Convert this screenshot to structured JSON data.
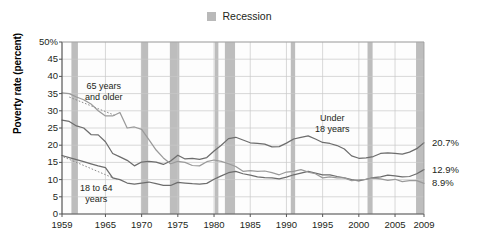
{
  "legend": {
    "swatch_name": "recession-swatch",
    "label": "Recession",
    "color": "#b9b9b9"
  },
  "axis": {
    "ylabel": "Poverty rate (percent)",
    "yticks": [
      "50%",
      "45",
      "40",
      "35",
      "30",
      "25",
      "20",
      "15",
      "10",
      "5",
      "0"
    ],
    "ytick_values": [
      50,
      45,
      40,
      35,
      30,
      25,
      20,
      15,
      10,
      5,
      0
    ],
    "xticks": [
      "1959",
      "1965",
      "1970",
      "1975",
      "1980",
      "1985",
      "1990",
      "1995",
      "2000",
      "2005",
      "2009"
    ],
    "xtick_values": [
      1959,
      1965,
      1970,
      1975,
      1980,
      1985,
      1990,
      1995,
      2000,
      2005,
      2009
    ]
  },
  "annotations": [
    {
      "name": "annot-65-and-older",
      "line1": "65 years",
      "line2": "and older"
    },
    {
      "name": "annot-18-to-64",
      "line1": "18 to 64",
      "line2": "years"
    },
    {
      "name": "annot-under-18",
      "line1": "Under",
      "line2": "18 years"
    }
  ],
  "end_labels": [
    {
      "name": "end-label-under-18",
      "text": "20.7%"
    },
    {
      "name": "end-label-18-to-64",
      "text": "12.9%"
    },
    {
      "name": "end-label-65-plus",
      "text": "8.9%"
    }
  ],
  "chart_data": {
    "type": "line",
    "title": "",
    "xlabel": "",
    "ylabel": "Poverty rate (percent)",
    "xlim": [
      1959,
      2009
    ],
    "ylim": [
      0,
      50
    ],
    "grid": true,
    "legend_position": "top-center",
    "legend_entries": [
      "Recession"
    ],
    "series": [
      {
        "name": "Under 18 years",
        "color": "#6d6d6d",
        "end_value": 20.7,
        "x": [
          1959,
          1960,
          1961,
          1962,
          1963,
          1964,
          1965,
          1966,
          1967,
          1968,
          1969,
          1970,
          1971,
          1972,
          1973,
          1974,
          1975,
          1976,
          1977,
          1978,
          1979,
          1980,
          1981,
          1982,
          1983,
          1984,
          1985,
          1986,
          1987,
          1988,
          1989,
          1990,
          1991,
          1992,
          1993,
          1994,
          1995,
          1996,
          1997,
          1998,
          1999,
          2000,
          2001,
          2002,
          2003,
          2004,
          2005,
          2006,
          2007,
          2008,
          2009
        ],
        "values": [
          27.3,
          26.9,
          25.6,
          25.0,
          23.1,
          23.0,
          21.0,
          17.6,
          16.6,
          15.6,
          14.0,
          15.1,
          15.3,
          15.1,
          14.4,
          15.4,
          17.1,
          16.0,
          16.2,
          15.9,
          16.4,
          18.3,
          20.0,
          21.9,
          22.3,
          21.5,
          20.7,
          20.5,
          20.3,
          19.5,
          19.6,
          20.6,
          21.8,
          22.3,
          22.7,
          21.8,
          20.8,
          20.5,
          19.9,
          18.9,
          16.9,
          16.2,
          16.3,
          16.7,
          17.6,
          17.8,
          17.6,
          17.4,
          18.0,
          19.0,
          20.7
        ]
      },
      {
        "name": "18 to 64 years",
        "color": "#6d6d6d",
        "end_value": 12.9,
        "x": [
          1959,
          1960,
          1961,
          1962,
          1963,
          1964,
          1965,
          1966,
          1967,
          1968,
          1969,
          1970,
          1971,
          1972,
          1973,
          1974,
          1975,
          1976,
          1977,
          1978,
          1979,
          1980,
          1981,
          1982,
          1983,
          1984,
          1985,
          1986,
          1987,
          1988,
          1989,
          1990,
          1991,
          1992,
          1993,
          1994,
          1995,
          1996,
          1997,
          1998,
          1999,
          2000,
          2001,
          2002,
          2003,
          2004,
          2005,
          2006,
          2007,
          2008,
          2009
        ],
        "values": [
          17.0,
          16.4,
          15.8,
          15.2,
          14.6,
          14.0,
          13.5,
          10.5,
          10.0,
          9.0,
          8.7,
          9.0,
          9.3,
          8.8,
          8.3,
          8.3,
          9.2,
          9.0,
          8.8,
          8.7,
          8.9,
          10.1,
          11.1,
          12.0,
          12.4,
          11.7,
          11.3,
          10.8,
          10.6,
          10.5,
          10.2,
          10.7,
          11.4,
          11.9,
          12.4,
          11.9,
          11.4,
          11.4,
          10.9,
          10.5,
          10.0,
          9.6,
          10.1,
          10.6,
          10.8,
          11.3,
          11.1,
          10.8,
          10.9,
          11.7,
          12.9
        ]
      },
      {
        "name": "65 years and older",
        "color": "#9a9a9a",
        "end_value": 8.9,
        "x": [
          1959,
          1960,
          1961,
          1962,
          1963,
          1964,
          1965,
          1966,
          1967,
          1968,
          1969,
          1970,
          1971,
          1972,
          1973,
          1974,
          1975,
          1976,
          1977,
          1978,
          1979,
          1980,
          1981,
          1982,
          1983,
          1984,
          1985,
          1986,
          1987,
          1988,
          1989,
          1990,
          1991,
          1992,
          1993,
          1994,
          1995,
          1996,
          1997,
          1998,
          1999,
          2000,
          2001,
          2002,
          2003,
          2004,
          2005,
          2006,
          2007,
          2008,
          2009
        ],
        "values": [
          35.2,
          35.0,
          34.0,
          33.2,
          32.0,
          30.0,
          28.5,
          28.5,
          29.5,
          25.0,
          25.3,
          24.6,
          21.6,
          18.6,
          16.3,
          14.6,
          15.3,
          15.0,
          14.1,
          14.0,
          15.2,
          15.7,
          15.3,
          14.6,
          13.8,
          12.4,
          12.6,
          12.4,
          12.5,
          12.0,
          11.4,
          12.2,
          12.4,
          12.9,
          12.2,
          11.7,
          10.5,
          10.8,
          10.5,
          10.5,
          9.7,
          9.9,
          10.1,
          10.4,
          10.2,
          9.8,
          10.1,
          9.4,
          9.7,
          9.7,
          8.9
        ]
      }
    ],
    "recession_bands": [
      {
        "start": 1960.3,
        "end": 1961.2
      },
      {
        "start": 1969.9,
        "end": 1970.9
      },
      {
        "start": 1973.9,
        "end": 1975.2
      },
      {
        "start": 1980.1,
        "end": 1980.6
      },
      {
        "start": 1981.5,
        "end": 1982.9
      },
      {
        "start": 1990.6,
        "end": 1991.2
      },
      {
        "start": 2001.2,
        "end": 2001.9
      },
      {
        "start": 2007.9,
        "end": 2009.4
      }
    ],
    "dotted_leaders": [
      {
        "name": "leader-65-plus",
        "x1": 1960.0,
        "y1": 34.0,
        "x2": 1966.5,
        "y2": 28.5
      },
      {
        "name": "leader-18-64",
        "x1": 1959.2,
        "y1": 16.6,
        "x2": 1966.6,
        "y2": 10.0
      }
    ]
  }
}
